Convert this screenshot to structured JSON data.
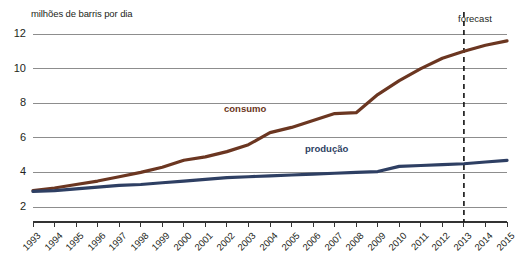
{
  "chart_data": {
    "type": "line",
    "title": "",
    "ylabel": "milhões de barris por dia",
    "xlabel": "",
    "ylim": [
      2,
      12
    ],
    "xlim": [
      1993,
      2015
    ],
    "grid": true,
    "legend_position": "inline-annotations",
    "yticks": [
      "2",
      "4",
      "6",
      "8",
      "10",
      "12"
    ],
    "ytick_values": [
      2,
      4,
      6,
      8,
      10,
      12
    ],
    "categories": [
      "1993",
      "1994",
      "1995",
      "1996",
      "1997",
      "1998",
      "1999",
      "2000",
      "2001",
      "2002",
      "2003",
      "2004",
      "2005",
      "2006",
      "2007",
      "2008",
      "2009",
      "2010",
      "2011",
      "2012",
      "2013",
      "2014",
      "2015"
    ],
    "x": [
      1993,
      1994,
      1995,
      1996,
      1997,
      1998,
      1999,
      2000,
      2001,
      2002,
      2003,
      2004,
      2005,
      2006,
      2007,
      2008,
      2009,
      2010,
      2011,
      2012,
      2013,
      2014,
      2015
    ],
    "series": [
      {
        "name": "consumo",
        "color": "#6b3621",
        "values": [
          2.95,
          3.1,
          3.3,
          3.5,
          3.75,
          4.0,
          4.3,
          4.7,
          4.9,
          5.2,
          5.6,
          6.3,
          6.6,
          7.0,
          7.4,
          7.45,
          8.5,
          9.3,
          10.0,
          10.6,
          11.0,
          11.35,
          11.6
        ]
      },
      {
        "name": "produção",
        "color": "#2e3f63",
        "values": [
          2.9,
          2.95,
          3.05,
          3.15,
          3.25,
          3.3,
          3.4,
          3.5,
          3.6,
          3.7,
          3.75,
          3.8,
          3.85,
          3.9,
          3.95,
          4.0,
          4.05,
          4.35,
          4.4,
          4.45,
          4.5,
          4.6,
          4.7
        ]
      }
    ],
    "annotations": [
      {
        "name": "forecast",
        "label": "forecast",
        "at_x": 2013,
        "style": "dashed-vertical-line"
      }
    ]
  }
}
